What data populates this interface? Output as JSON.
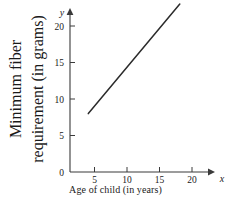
{
  "chart_data": {
    "type": "line",
    "title": "",
    "xlabel": "Age of child (in years)",
    "ylabel_line1": "Minimum fiber",
    "ylabel_line2": "requirement (in grams)",
    "ylabel": "Minimum fiber requirement (in grams)",
    "x_axis_variable": "x",
    "y_axis_variable": "y",
    "origin_label": "0",
    "xlim": [
      0,
      22
    ],
    "ylim": [
      0,
      24
    ],
    "xticks": [
      5,
      10,
      15,
      20
    ],
    "yticks": [
      5,
      10,
      15,
      20
    ],
    "xtick_labels": [
      "5",
      "10",
      "15",
      "20"
    ],
    "ytick_labels": [
      "5",
      "10",
      "15",
      "20"
    ],
    "grid": false,
    "legend": false,
    "series": [
      {
        "name": "Minimum fiber requirement",
        "x": [
          3,
          18
        ],
        "y": [
          8,
          23
        ],
        "color": "#2b2b2b"
      }
    ]
  },
  "colors": {
    "axis": "#3a3a3a",
    "line": "#2b2b2b",
    "background": "#ffffff",
    "text": "#1a1a1a"
  }
}
